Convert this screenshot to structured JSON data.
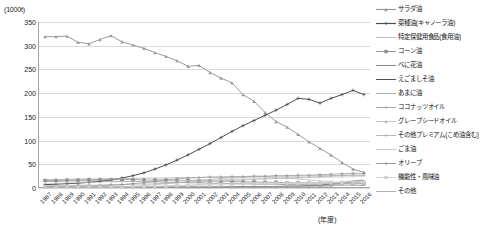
{
  "chart_data": {
    "type": "line",
    "title": "",
    "unit_label": "(1000t)",
    "xlabel": "(年度)",
    "ylabel": "",
    "ylim": [
      0,
      350
    ],
    "yticks": [
      0,
      50,
      100,
      150,
      200,
      250,
      300,
      350
    ],
    "grid": true,
    "legend_position": "right",
    "categories": [
      "1987",
      "1988",
      "1989",
      "1990",
      "1991",
      "1992",
      "1993",
      "1994",
      "1995",
      "1996",
      "1997",
      "1998",
      "1999",
      "2000",
      "2001",
      "2002",
      "2003",
      "2004",
      "2005",
      "2006",
      "2007",
      "2008",
      "2009",
      "2010",
      "2011",
      "2012",
      "2013",
      "2014",
      "2015",
      "2016"
    ],
    "series": [
      {
        "name": "サラダ油",
        "color": "#9a9a9a",
        "marker": "triangle",
        "values": [
          319,
          319,
          320,
          307,
          304,
          313,
          321,
          308,
          301,
          294,
          285,
          277,
          268,
          256,
          258,
          243,
          231,
          221,
          196,
          182,
          158,
          139,
          127,
          112,
          96,
          82,
          68,
          52,
          38,
          31
        ]
      },
      {
        "name": "菜種油(キャノーラ油)",
        "color": "#4d4d4d",
        "marker": "plus",
        "values": [
          5,
          6,
          7,
          8,
          10,
          12,
          15,
          19,
          24,
          30,
          38,
          47,
          57,
          68,
          80,
          92,
          105,
          118,
          130,
          141,
          152,
          163,
          175,
          188,
          186,
          178,
          188,
          196,
          205,
          196
        ]
      },
      {
        "name": "特定保健用食品(食用油)",
        "color": "#b5b5b5",
        "marker": "dash",
        "values": [
          0,
          0,
          0,
          0,
          0,
          0,
          0,
          1,
          2,
          3,
          5,
          7,
          9,
          12,
          14,
          16,
          18,
          19,
          20,
          21,
          21,
          20,
          19,
          17,
          15,
          13,
          11,
          9,
          8,
          7
        ]
      },
      {
        "name": "コーン油",
        "color": "#8c8c8c",
        "marker": "square",
        "values": [
          14,
          14,
          15,
          15,
          16,
          16,
          16,
          16,
          16,
          15,
          15,
          15,
          14,
          14,
          13,
          13,
          12,
          12,
          11,
          11,
          10,
          10,
          9,
          9,
          9,
          8,
          8,
          8,
          7,
          7
        ]
      },
      {
        "name": "べに花油",
        "color": "#7a7a7a",
        "marker": "line",
        "values": [
          12,
          12,
          13,
          13,
          13,
          13,
          12,
          12,
          12,
          11,
          11,
          10,
          10,
          9,
          9,
          8,
          8,
          7,
          7,
          6,
          6,
          6,
          5,
          5,
          5,
          4,
          4,
          4,
          4,
          3
        ]
      },
      {
        "name": "えごましそ油",
        "color": "#3d3d3d",
        "marker": "line",
        "values": [
          0,
          0,
          0,
          0,
          0,
          0,
          0,
          0,
          0,
          0,
          0,
          0,
          0,
          0,
          0,
          0,
          0,
          1,
          1,
          1,
          1,
          1,
          2,
          2,
          3,
          4,
          6,
          9,
          12,
          14
        ]
      },
      {
        "name": "あまに油",
        "color": "#a3a3a3",
        "marker": "line",
        "values": [
          0,
          0,
          0,
          0,
          0,
          0,
          0,
          0,
          0,
          0,
          0,
          0,
          0,
          0,
          0,
          0,
          0,
          0,
          0,
          0,
          0,
          1,
          1,
          1,
          2,
          3,
          5,
          9,
          13,
          15
        ]
      },
      {
        "name": "ココナッツオイル",
        "color": "#9e9e9e",
        "marker": "plus",
        "values": [
          0,
          0,
          0,
          0,
          0,
          0,
          0,
          0,
          0,
          0,
          0,
          0,
          0,
          0,
          0,
          0,
          0,
          0,
          0,
          0,
          0,
          0,
          0,
          0,
          0,
          1,
          2,
          6,
          11,
          8
        ]
      },
      {
        "name": "グレープシードオイル",
        "color": "#bdbdbd",
        "marker": "triangle",
        "values": [
          0,
          0,
          0,
          0,
          0,
          0,
          0,
          0,
          0,
          1,
          1,
          2,
          3,
          4,
          5,
          6,
          7,
          8,
          8,
          9,
          9,
          9,
          9,
          8,
          8,
          8,
          8,
          8,
          8,
          7
        ]
      },
      {
        "name": "その他プレミアム(こめ油含む)",
        "color": "#b0b0b0",
        "marker": "plus",
        "values": [
          3,
          3,
          3,
          4,
          4,
          4,
          5,
          5,
          6,
          6,
          7,
          8,
          9,
          10,
          11,
          12,
          13,
          14,
          15,
          16,
          17,
          18,
          19,
          20,
          21,
          22,
          23,
          24,
          25,
          25
        ]
      },
      {
        "name": "ごま油",
        "color": "#c2c2c2",
        "marker": "line",
        "values": [
          8,
          8,
          9,
          9,
          10,
          10,
          11,
          11,
          12,
          12,
          13,
          13,
          14,
          14,
          15,
          15,
          16,
          16,
          17,
          17,
          18,
          18,
          19,
          19,
          20,
          20,
          21,
          21,
          22,
          22
        ]
      },
      {
        "name": "オリーブ",
        "color": "#8f8f8f",
        "marker": "plus",
        "values": [
          1,
          1,
          1,
          2,
          2,
          3,
          4,
          5,
          7,
          9,
          12,
          15,
          17,
          19,
          20,
          21,
          21,
          22,
          22,
          23,
          23,
          24,
          24,
          25,
          25,
          26,
          27,
          28,
          29,
          29
        ]
      },
      {
        "name": "機能性・風味油",
        "color": "#cfcfcf",
        "marker": "square",
        "values": [
          0,
          0,
          0,
          0,
          0,
          0,
          0,
          0,
          1,
          1,
          2,
          2,
          3,
          3,
          4,
          4,
          5,
          5,
          6,
          6,
          7,
          7,
          8,
          8,
          9,
          9,
          10,
          10,
          11,
          11
        ]
      },
      {
        "name": "その他",
        "color": "#a8a8a8",
        "marker": "line",
        "values": [
          16,
          16,
          16,
          17,
          17,
          17,
          18,
          18,
          18,
          19,
          19,
          19,
          20,
          20,
          20,
          21,
          21,
          21,
          22,
          22,
          22,
          23,
          23,
          23,
          24,
          24,
          24,
          25,
          25,
          25
        ]
      }
    ]
  }
}
